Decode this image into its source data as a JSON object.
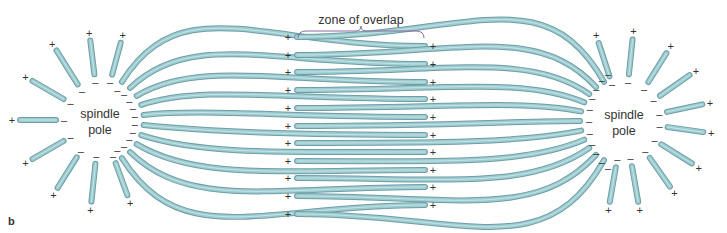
{
  "figure": {
    "panel_label": "b",
    "zone_label": "zone of overlap",
    "left_pole_label": [
      "spindle",
      "pole"
    ],
    "right_pole_label": [
      "spindle",
      "pole"
    ],
    "plus_sign": "+",
    "minus_sign": "–"
  },
  "colors": {
    "microtubule_fill": "#9ccbd0",
    "microtubule_outline": "#6f9ea6",
    "text": "#333333",
    "brace": "#8a6a9a"
  },
  "geometry": {
    "left_pole_center": [
      100,
      120
    ],
    "right_pole_center": [
      624,
      121
    ],
    "zone_brace": {
      "x1": 298,
      "x2": 424,
      "y": 33,
      "label_y": 24
    },
    "rows_from_right_pole": [
      37,
      55,
      72,
      90,
      108,
      126,
      143,
      161,
      178,
      196,
      214
    ],
    "rows_from_left_pole": [
      46,
      64,
      82,
      99,
      117,
      135,
      152,
      170,
      187,
      205
    ],
    "overlap_left_x": 297,
    "overlap_right_x": 425
  },
  "astral": {
    "left": [
      {
        "angle": 180,
        "inner": 44,
        "outer": 80
      },
      {
        "angle": 150,
        "inner": 42,
        "outer": 78
      },
      {
        "angle": 122,
        "inner": 42,
        "outer": 82
      },
      {
        "angle": 97,
        "inner": 46,
        "outer": 80
      },
      {
        "angle": 75,
        "inner": 47,
        "outer": 80
      },
      {
        "angle": 210,
        "inner": 42,
        "outer": 78
      },
      {
        "angle": 238,
        "inner": 44,
        "outer": 80
      },
      {
        "angle": 264,
        "inner": 44,
        "outer": 82
      },
      {
        "angle": 290,
        "inner": 46,
        "outer": 80
      }
    ],
    "right": [
      {
        "angle": 108,
        "inner": 47,
        "outer": 82
      },
      {
        "angle": 84,
        "inner": 47,
        "outer": 82
      },
      {
        "angle": 58,
        "inner": 46,
        "outer": 80
      },
      {
        "angle": 35,
        "inner": 44,
        "outer": 80
      },
      {
        "angle": 12,
        "inner": 44,
        "outer": 80
      },
      {
        "angle": -8,
        "inner": 44,
        "outer": 80
      },
      {
        "angle": -32,
        "inner": 44,
        "outer": 80
      },
      {
        "angle": -55,
        "inner": 45,
        "outer": 80
      },
      {
        "angle": -80,
        "inner": 46,
        "outer": 82
      },
      {
        "angle": -100,
        "inner": 47,
        "outer": 82
      }
    ]
  }
}
